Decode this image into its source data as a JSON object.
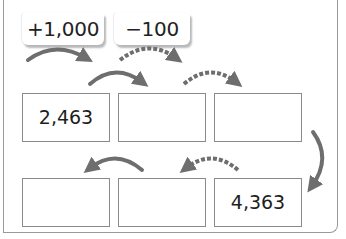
{
  "legend": {
    "tags": [
      {
        "label": "+1,000",
        "arrow_style": "solid"
      },
      {
        "label": "−100",
        "arrow_style": "dashed"
      }
    ]
  },
  "grid": {
    "row1": [
      {
        "value": "2,463"
      },
      {
        "value": ""
      },
      {
        "value": ""
      }
    ],
    "row2": [
      {
        "value": ""
      },
      {
        "value": ""
      },
      {
        "value": "4,363"
      }
    ]
  },
  "arrows": {
    "row1": [
      "solid",
      "dashed"
    ],
    "turn": "solid",
    "row2": [
      "solid",
      "dashed"
    ]
  },
  "colors": {
    "arrow": "#6e6e6e",
    "box_border": "#8a8a8a",
    "frame": "#9a9a9a",
    "text": "#1e1e1e"
  }
}
